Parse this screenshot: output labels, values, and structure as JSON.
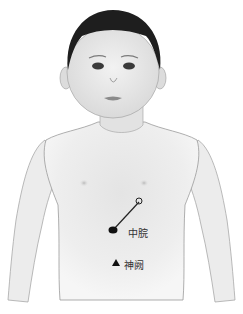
{
  "figure": {
    "acupoints": [
      {
        "id": "zhongwan",
        "label": "中脘",
        "marker": "filled-ellipse-with-needle"
      },
      {
        "id": "shenque",
        "label": "神阙",
        "marker": "filled-triangle"
      }
    ],
    "colors": {
      "background": "#ffffff",
      "skin": "#efefef",
      "skin_shadow": "#d6d6d6",
      "outline": "#9a9a9a",
      "hair": "#1e1e1e",
      "marker": "#111111",
      "label": "#333333"
    }
  }
}
